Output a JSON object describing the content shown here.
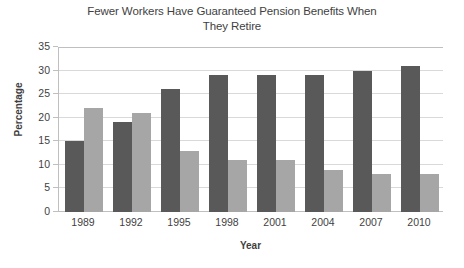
{
  "chart_data": {
    "type": "bar",
    "title": "Fewer Workers Have Guaranteed Pension Benefits When They Retire",
    "title_lines": [
      "Fewer Workers Have Guaranteed Pension Benefits When",
      "They Retire"
    ],
    "xlabel": "Year",
    "ylabel": "Percentage",
    "categories": [
      "1989",
      "1992",
      "1995",
      "1998",
      "2001",
      "2004",
      "2007",
      "2010"
    ],
    "series": [
      {
        "name": "Series 1",
        "color": "#595959",
        "values": [
          15,
          19,
          26,
          29,
          29,
          29,
          30,
          31
        ]
      },
      {
        "name": "Series 2",
        "color": "#a6a6a6",
        "values": [
          22,
          21,
          13,
          11,
          11,
          9,
          8,
          8
        ]
      }
    ],
    "ylim": [
      0,
      35
    ],
    "yticks": [
      0,
      5,
      10,
      15,
      20,
      25,
      30,
      35
    ],
    "ytick_labels": [
      "0",
      "5",
      "10",
      "15",
      "20",
      "25",
      "30",
      "35"
    ],
    "grid": true,
    "legend": false,
    "legend_position": "none",
    "background_color": "#ffffff",
    "gridline_color": "#d9d9d9",
    "axis_color": "#bfbfbf",
    "text_color": "#3f3f3f"
  }
}
